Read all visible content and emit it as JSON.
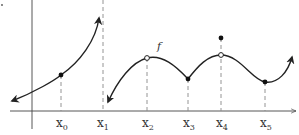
{
  "diagram": {
    "function_label": "f",
    "axis_color": "#444444",
    "curve_color": "#222222",
    "dash_color": "#888888",
    "x_labels": [
      {
        "base": "x",
        "sub": "0"
      },
      {
        "base": "x",
        "sub": "1"
      },
      {
        "base": "x",
        "sub": "2"
      },
      {
        "base": "x",
        "sub": "3"
      },
      {
        "base": "x",
        "sub": "4"
      },
      {
        "base": "x",
        "sub": "5"
      }
    ],
    "features": [
      {
        "at": "x0",
        "type": "filled point on continuous curve"
      },
      {
        "at": "x1",
        "type": "vertical asymptote (dashed)"
      },
      {
        "at": "x2",
        "type": "open circle (removable discontinuity)"
      },
      {
        "at": "x3",
        "type": "filled point at corner (cusp)"
      },
      {
        "at": "x4",
        "type": "open circle on curve, filled point above (point discontinuity)"
      },
      {
        "at": "x5",
        "type": "filled point at local minimum"
      }
    ]
  }
}
